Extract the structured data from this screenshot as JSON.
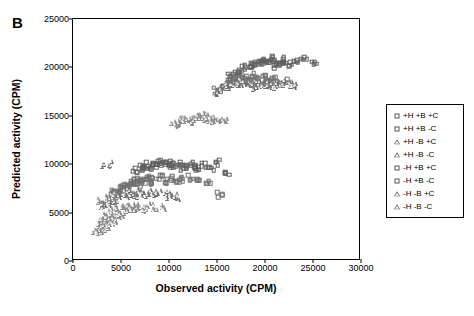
{
  "panel": {
    "label": "B"
  },
  "chart_data": {
    "type": "scatter",
    "title": "",
    "xlabel": "Observed activity (CPM)",
    "ylabel": "Predicted activity (CPM)",
    "xlim": [
      0,
      30000
    ],
    "ylim": [
      0,
      25000
    ],
    "xticks": [
      0,
      5000,
      10000,
      15000,
      20000,
      25000,
      30000
    ],
    "yticks": [
      0,
      5000,
      10000,
      15000,
      20000,
      25000
    ],
    "xtick_labels": [
      "0",
      "5000",
      "10000",
      "15000",
      "20000",
      "25000",
      "30000"
    ],
    "ytick_labels": [
      "0",
      "5000",
      "10000",
      "15000",
      "20000",
      "25000"
    ],
    "grid": false,
    "legend_position": "right-outside",
    "series": [
      {
        "name": "+H +B +C",
        "marker": "square",
        "color": "#606060",
        "points": [
          [
            17800,
            19900
          ],
          [
            18400,
            20200
          ],
          [
            19100,
            20400
          ],
          [
            19600,
            20600
          ],
          [
            20200,
            20700
          ],
          [
            20800,
            20900
          ],
          [
            21400,
            20500
          ],
          [
            22000,
            20800
          ],
          [
            22600,
            20300
          ],
          [
            23300,
            20600
          ],
          [
            24100,
            20800
          ],
          [
            25000,
            20400
          ],
          [
            18900,
            20100
          ],
          [
            19900,
            20500
          ],
          [
            20500,
            20600
          ],
          [
            21100,
            20200
          ],
          [
            21800,
            20600
          ],
          [
            17400,
            19600
          ],
          [
            16900,
            19300
          ],
          [
            16400,
            19100
          ]
        ]
      },
      {
        "name": "+H +B -C",
        "marker": "square",
        "color": "#707070",
        "points": [
          [
            15900,
            18300
          ],
          [
            16400,
            18500
          ],
          [
            16900,
            18700
          ],
          [
            17400,
            18900
          ],
          [
            17900,
            19000
          ],
          [
            18400,
            18800
          ],
          [
            18900,
            19100
          ],
          [
            19400,
            18600
          ],
          [
            19900,
            18900
          ],
          [
            20400,
            18500
          ],
          [
            20900,
            18700
          ],
          [
            21400,
            18300
          ],
          [
            22100,
            18600
          ],
          [
            16200,
            18000
          ],
          [
            17100,
            18400
          ],
          [
            18100,
            18600
          ],
          [
            19100,
            18300
          ],
          [
            20100,
            18400
          ],
          [
            15400,
            17800
          ],
          [
            14900,
            17600
          ]
        ]
      },
      {
        "name": "+H -B +C",
        "marker": "triangle",
        "color": "#707070",
        "points": [
          [
            15800,
            18000
          ],
          [
            16300,
            18200
          ],
          [
            16800,
            18400
          ],
          [
            17300,
            18600
          ],
          [
            17800,
            18300
          ],
          [
            18300,
            18500
          ],
          [
            18800,
            18200
          ],
          [
            19300,
            18400
          ],
          [
            19800,
            18100
          ],
          [
            20300,
            18300
          ],
          [
            20800,
            18000
          ],
          [
            21300,
            18200
          ],
          [
            21900,
            18400
          ],
          [
            16100,
            17800
          ],
          [
            17000,
            18100
          ],
          [
            18000,
            18300
          ],
          [
            19000,
            18000
          ],
          [
            20000,
            18200
          ],
          [
            15300,
            17600
          ],
          [
            14800,
            17400
          ],
          [
            22600,
            18300
          ],
          [
            23200,
            18100
          ]
        ]
      },
      {
        "name": "+H -B -C",
        "marker": "triangle",
        "color": "#8a8a8a",
        "points": [
          [
            10800,
            14300
          ],
          [
            11300,
            14500
          ],
          [
            11800,
            14600
          ],
          [
            12300,
            14700
          ],
          [
            12800,
            14800
          ],
          [
            13300,
            14900
          ],
          [
            13800,
            15000
          ],
          [
            14300,
            14600
          ],
          [
            14800,
            14700
          ],
          [
            15300,
            14500
          ],
          [
            11000,
            14200
          ],
          [
            11600,
            14400
          ],
          [
            12100,
            14500
          ],
          [
            12700,
            14600
          ],
          [
            13100,
            14800
          ],
          [
            13600,
            14700
          ],
          [
            14100,
            14500
          ],
          [
            14600,
            14400
          ],
          [
            10500,
            14100
          ],
          [
            15800,
            14500
          ]
        ]
      },
      {
        "name": "-H +B +C",
        "marker": "square",
        "color": "#606060",
        "points": [
          [
            7000,
            9700
          ],
          [
            7600,
            9900
          ],
          [
            8200,
            10100
          ],
          [
            8800,
            10300
          ],
          [
            9400,
            10000
          ],
          [
            10000,
            10200
          ],
          [
            10600,
            9900
          ],
          [
            11200,
            10100
          ],
          [
            11800,
            9800
          ],
          [
            12400,
            10000
          ],
          [
            13000,
            9700
          ],
          [
            13700,
            9900
          ],
          [
            14400,
            9600
          ],
          [
            6500,
            9400
          ],
          [
            7200,
            9600
          ],
          [
            8000,
            9800
          ],
          [
            9000,
            9900
          ],
          [
            10300,
            9800
          ],
          [
            11500,
            9700
          ],
          [
            12800,
            9500
          ],
          [
            15100,
            10200
          ],
          [
            16000,
            9000
          ]
        ]
      },
      {
        "name": "-H +B -C",
        "marker": "square",
        "color": "#707070",
        "points": [
          [
            4200,
            7200
          ],
          [
            4800,
            7500
          ],
          [
            5400,
            7800
          ],
          [
            6000,
            8100
          ],
          [
            6600,
            8300
          ],
          [
            7200,
            8500
          ],
          [
            7800,
            8700
          ],
          [
            8400,
            8400
          ],
          [
            9000,
            8600
          ],
          [
            9600,
            8300
          ],
          [
            10200,
            8500
          ],
          [
            10800,
            8200
          ],
          [
            11500,
            8400
          ],
          [
            4500,
            7000
          ],
          [
            5100,
            7300
          ],
          [
            5700,
            7600
          ],
          [
            6300,
            7900
          ],
          [
            6900,
            8000
          ],
          [
            7500,
            8200
          ],
          [
            8100,
            8000
          ],
          [
            12200,
            8600
          ],
          [
            13000,
            8300
          ],
          [
            14100,
            8100
          ],
          [
            15300,
            6900
          ]
        ]
      },
      {
        "name": "-H -B +C",
        "marker": "triangle",
        "color": "#707070",
        "points": [
          [
            3400,
            6000
          ],
          [
            3900,
            6300
          ],
          [
            4400,
            6600
          ],
          [
            4900,
            6900
          ],
          [
            5400,
            7100
          ],
          [
            5900,
            7300
          ],
          [
            6400,
            7000
          ],
          [
            6900,
            7200
          ],
          [
            7400,
            6900
          ],
          [
            7900,
            7100
          ],
          [
            8400,
            6800
          ],
          [
            8900,
            7000
          ],
          [
            9500,
            6700
          ],
          [
            3600,
            5800
          ],
          [
            4100,
            6100
          ],
          [
            4600,
            6400
          ],
          [
            5100,
            6700
          ],
          [
            5600,
            6800
          ],
          [
            6100,
            7000
          ],
          [
            6600,
            6800
          ],
          [
            10100,
            6900
          ],
          [
            10800,
            6600
          ],
          [
            2900,
            5700
          ],
          [
            3200,
            9800
          ],
          [
            3800,
            10000
          ]
        ]
      },
      {
        "name": "-H -B -C",
        "marker": "triangle",
        "color": "#8a8a8a",
        "points": [
          [
            2500,
            3200
          ],
          [
            2900,
            3500
          ],
          [
            3300,
            3800
          ],
          [
            3700,
            4100
          ],
          [
            4100,
            4400
          ],
          [
            4500,
            4700
          ],
          [
            4900,
            5000
          ],
          [
            5300,
            5300
          ],
          [
            5700,
            5500
          ],
          [
            6100,
            5700
          ],
          [
            6500,
            5400
          ],
          [
            6900,
            5600
          ],
          [
            7300,
            5300
          ],
          [
            7700,
            5500
          ],
          [
            2700,
            3000
          ],
          [
            3100,
            3300
          ],
          [
            3500,
            3600
          ],
          [
            3900,
            3900
          ],
          [
            4300,
            4200
          ],
          [
            4700,
            4500
          ],
          [
            5100,
            4800
          ],
          [
            5500,
            5100
          ],
          [
            5900,
            5300
          ],
          [
            6300,
            5500
          ],
          [
            8100,
            5700
          ],
          [
            8600,
            5400
          ],
          [
            2300,
            2900
          ],
          [
            2600,
            4000
          ],
          [
            3000,
            4300
          ],
          [
            3400,
            4600
          ],
          [
            3800,
            4900
          ],
          [
            4200,
            5200
          ],
          [
            4600,
            5500
          ],
          [
            5000,
            5800
          ],
          [
            2800,
            6200
          ],
          [
            3600,
            6500
          ],
          [
            4400,
            6800
          ],
          [
            9000,
            5600
          ],
          [
            9600,
            5300
          ]
        ]
      }
    ],
    "legend_entries": [
      {
        "label": "+H +B +C",
        "marker": "square"
      },
      {
        "label": "+H +B -C",
        "marker": "square"
      },
      {
        "label": "+H -B +C",
        "marker": "triangle"
      },
      {
        "label": "+H -B -C",
        "marker": "triangle"
      },
      {
        "label": "-H +B +C",
        "marker": "square"
      },
      {
        "label": "-H +B -C",
        "marker": "square"
      },
      {
        "label": "-H -B +C",
        "marker": "triangle"
      },
      {
        "label": "-H -B -C",
        "marker": "triangle"
      }
    ]
  }
}
